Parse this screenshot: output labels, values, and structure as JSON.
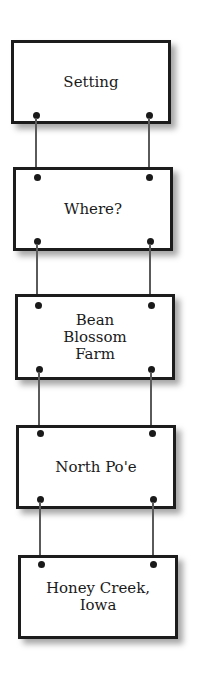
{
  "diagram": {
    "type": "hanging-sign-chain",
    "colors": {
      "border": "#1c1c1c",
      "text": "#1a1a1a",
      "chain": "#5a5a5a",
      "background": "#ffffff"
    },
    "signs": [
      {
        "label": "Setting"
      },
      {
        "label": "Where?"
      },
      {
        "label": "Bean Blossom Farm"
      },
      {
        "label": "North Po'e"
      },
      {
        "label": "Honey Creek, Iowa"
      }
    ]
  }
}
